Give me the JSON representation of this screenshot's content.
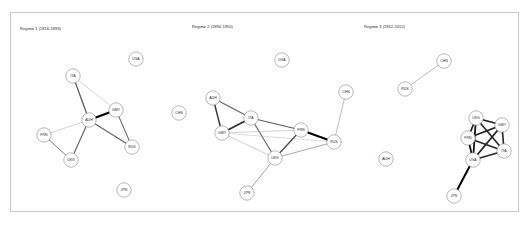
{
  "figure": {
    "background": "#ffffff",
    "border_color": "#c8c8c8"
  },
  "panels": [
    {
      "id": "panel-1",
      "title": "Regime 1 (1816-1893)",
      "nodes": [
        {
          "id": "USA",
          "label": "USA",
          "x": 125,
          "y": 46
        },
        {
          "id": "ITA",
          "label": "ITA",
          "x": 62,
          "y": 63
        },
        {
          "id": "GMY",
          "label": "GMY",
          "x": 105,
          "y": 97
        },
        {
          "id": "CHN",
          "label": "CHN",
          "x": 168,
          "y": 100
        },
        {
          "id": "AUH",
          "label": "AUH",
          "x": 78,
          "y": 107
        },
        {
          "id": "FRN",
          "label": "FRN",
          "x": 33,
          "y": 122
        },
        {
          "id": "RUS",
          "label": "RUS",
          "x": 121,
          "y": 134
        },
        {
          "id": "UKG",
          "label": "UKG",
          "x": 60,
          "y": 147
        },
        {
          "id": "JPN",
          "label": "JPN",
          "x": 113,
          "y": 177
        }
      ],
      "edges": [
        {
          "source": "ITA",
          "target": "AUH",
          "weight": 0.55
        },
        {
          "source": "ITA",
          "target": "GMY",
          "weight": 0.12
        },
        {
          "source": "AUH",
          "target": "GMY",
          "weight": 1.0
        },
        {
          "source": "AUH",
          "target": "RUS",
          "weight": 0.5
        },
        {
          "source": "AUH",
          "target": "FRN",
          "weight": 0.14
        },
        {
          "source": "AUH",
          "target": "UKG",
          "weight": 0.5
        },
        {
          "source": "GMY",
          "target": "RUS",
          "weight": 0.45
        },
        {
          "source": "FRN",
          "target": "UKG",
          "weight": 0.4
        }
      ]
    },
    {
      "id": "panel-2",
      "title": "Regime 2 (1894-1950)",
      "nodes": [
        {
          "id": "USA",
          "label": "USA",
          "x": 96,
          "y": 47
        },
        {
          "id": "CHN",
          "label": "CHN",
          "x": 160,
          "y": 79
        },
        {
          "id": "AUH",
          "label": "AUH",
          "x": 27,
          "y": 85
        },
        {
          "id": "ITA",
          "label": "ITA",
          "x": 65,
          "y": 105
        },
        {
          "id": "FRN",
          "label": "FRN",
          "x": 115,
          "y": 117
        },
        {
          "id": "GMY",
          "label": "GMY",
          "x": 36,
          "y": 120
        },
        {
          "id": "RUS",
          "label": "RUS",
          "x": 148,
          "y": 129
        },
        {
          "id": "UKG",
          "label": "UKG",
          "x": 89,
          "y": 145
        },
        {
          "id": "JPN",
          "label": "JPN",
          "x": 61,
          "y": 180
        }
      ],
      "edges": [
        {
          "source": "AUH",
          "target": "ITA",
          "weight": 0.5
        },
        {
          "source": "AUH",
          "target": "GMY",
          "weight": 0.7
        },
        {
          "source": "ITA",
          "target": "GMY",
          "weight": 0.8
        },
        {
          "source": "ITA",
          "target": "FRN",
          "weight": 0.55
        },
        {
          "source": "ITA",
          "target": "UKG",
          "weight": 0.5
        },
        {
          "source": "GMY",
          "target": "FRN",
          "weight": 0.15
        },
        {
          "source": "GMY",
          "target": "UKG",
          "weight": 0.15
        },
        {
          "source": "GMY",
          "target": "RUS",
          "weight": 0.1
        },
        {
          "source": "FRN",
          "target": "UKG",
          "weight": 0.62
        },
        {
          "source": "FRN",
          "target": "RUS",
          "weight": 1.0
        },
        {
          "source": "UKG",
          "target": "RUS",
          "weight": 0.28
        },
        {
          "source": "UKG",
          "target": "JPN",
          "weight": 0.3
        },
        {
          "source": "CHN",
          "target": "RUS",
          "weight": 0.22
        }
      ]
    },
    {
      "id": "panel-3",
      "title": "Regime 3 (1952-2012)",
      "nodes": [
        {
          "id": "CHN",
          "label": "CHN",
          "x": 88,
          "y": 48
        },
        {
          "id": "RUS",
          "label": "RUS",
          "x": 49,
          "y": 76
        },
        {
          "id": "UKG",
          "label": "UKG",
          "x": 120,
          "y": 105
        },
        {
          "id": "GMY",
          "label": "GMY",
          "x": 146,
          "y": 112
        },
        {
          "id": "FRN",
          "label": "FRN",
          "x": 112,
          "y": 125
        },
        {
          "id": "ITA",
          "label": "ITA",
          "x": 148,
          "y": 138
        },
        {
          "id": "AUH",
          "label": "AUH",
          "x": 30,
          "y": 146
        },
        {
          "id": "USA",
          "label": "USA",
          "x": 117,
          "y": 147
        },
        {
          "id": "JPN",
          "label": "JPN",
          "x": 98,
          "y": 183
        }
      ],
      "edges": [
        {
          "source": "RUS",
          "target": "CHN",
          "weight": 0.22
        },
        {
          "source": "UKG",
          "target": "GMY",
          "weight": 0.85
        },
        {
          "source": "UKG",
          "target": "FRN",
          "weight": 0.85
        },
        {
          "source": "UKG",
          "target": "ITA",
          "weight": 0.8
        },
        {
          "source": "UKG",
          "target": "USA",
          "weight": 0.9
        },
        {
          "source": "GMY",
          "target": "FRN",
          "weight": 0.85
        },
        {
          "source": "GMY",
          "target": "ITA",
          "weight": 0.8
        },
        {
          "source": "GMY",
          "target": "USA",
          "weight": 0.85
        },
        {
          "source": "FRN",
          "target": "ITA",
          "weight": 0.8
        },
        {
          "source": "FRN",
          "target": "USA",
          "weight": 0.9
        },
        {
          "source": "ITA",
          "target": "USA",
          "weight": 0.8
        },
        {
          "source": "USA",
          "target": "JPN",
          "weight": 1.0
        }
      ]
    }
  ],
  "node_style": {
    "radius": 7.2,
    "fill": "#ffffff",
    "stroke": "#7d7d7d"
  },
  "edge_style": {
    "min_width": 0.3,
    "max_width": 2.0,
    "light_color": "#c9c9c9",
    "dark_color": "#000000"
  }
}
